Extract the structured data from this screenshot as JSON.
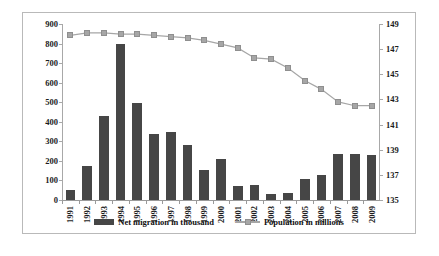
{
  "chart_data": {
    "type": "bar",
    "title": "",
    "subtitle": "",
    "xlabel": "",
    "ylabel": "",
    "grid": false,
    "legend_position": "bottom",
    "categories": [
      "1991",
      "1992",
      "1993",
      "1994",
      "1995",
      "1996",
      "1997",
      "1998",
      "1999",
      "2000",
      "2001",
      "2002",
      "2003",
      "2004",
      "2005",
      "2006",
      "2007",
      "2008",
      "2009"
    ],
    "y_left": {
      "label": "Net migration in thousand",
      "ticks": [
        0,
        100,
        200,
        300,
        400,
        500,
        600,
        700,
        800,
        900
      ],
      "ylim": [
        0,
        900
      ]
    },
    "y_right": {
      "label": "Population in millions",
      "ticks": [
        135,
        137,
        139,
        141,
        143,
        145,
        147,
        149
      ],
      "ylim": [
        135,
        149
      ]
    },
    "series": [
      {
        "name": "Net migration in thousand",
        "type": "bar",
        "axis": "left",
        "color": "#464646",
        "values": [
          52,
          175,
          430,
          800,
          497,
          340,
          348,
          280,
          152,
          208,
          72,
          78,
          32,
          38,
          105,
          130,
          233,
          233,
          232
        ]
      },
      {
        "name": "Population in millions",
        "type": "line",
        "axis": "right",
        "color": "#a6a6a6",
        "marker": "square",
        "values": [
          148.1,
          148.3,
          148.3,
          148.2,
          148.2,
          148.1,
          148.0,
          147.9,
          147.7,
          147.4,
          147.1,
          146.3,
          146.2,
          145.5,
          144.5,
          143.8,
          142.8,
          142.5,
          142.5
        ]
      }
    ]
  },
  "legend": {
    "items": [
      {
        "label": "Net migration in thousand",
        "marker": "bar-swatch",
        "color": "#464646"
      },
      {
        "label": "Population in millions",
        "marker": "line-square-swatch",
        "color": "#a6a6a6"
      }
    ]
  }
}
